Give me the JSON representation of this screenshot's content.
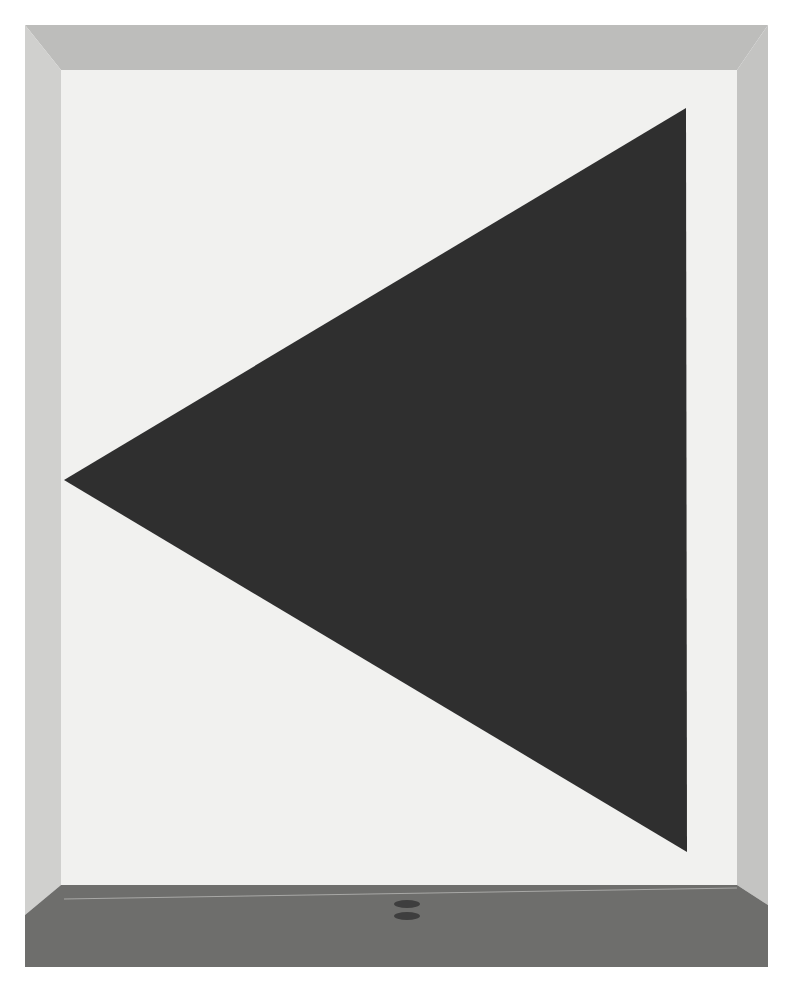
{
  "image": {
    "subject": "Gallery installation: large dark triangle painted on a white wall",
    "width": 789,
    "height": 985
  },
  "scene": {
    "frame": {
      "left": 25,
      "top": 25,
      "right": 768,
      "bottom": 967
    },
    "back_wall": {
      "left": 61,
      "top": 70,
      "right": 737,
      "bottom": 885,
      "color": "#f1f1ef"
    },
    "ceiling": {
      "color": "#bdbdbb"
    },
    "left_wall": {
      "color": "#d0d0ce"
    },
    "right_wall": {
      "color": "#c4c4c2"
    },
    "floor": {
      "top": 885,
      "color": "#6e6e6c",
      "baseboard_line_color": "#a8a8a6"
    },
    "triangle": {
      "points": [
        [
          686,
          108
        ],
        [
          687,
          852
        ],
        [
          64,
          480
        ]
      ],
      "color": "#2f2f2f"
    },
    "floor_drains": [
      {
        "cx": 407,
        "cy": 904,
        "rx": 13,
        "ry": 4
      },
      {
        "cx": 407,
        "cy": 916,
        "rx": 13,
        "ry": 4
      }
    ]
  }
}
